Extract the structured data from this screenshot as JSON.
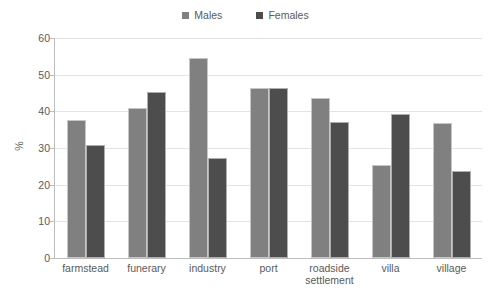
{
  "chart_data": {
    "type": "bar",
    "title": "",
    "xlabel": "",
    "ylabel": "%",
    "ylim": [
      0,
      60
    ],
    "ytick_step": 10,
    "yticks": [
      60,
      50,
      40,
      30,
      20,
      10,
      0
    ],
    "grid": true,
    "legend_position": "top-center",
    "categories": [
      "farmstead",
      "funerary",
      "industry",
      "port",
      "roadside\nsettlement",
      "villa",
      "village"
    ],
    "series": [
      {
        "name": "Males",
        "color": "#808080",
        "values": [
          37.6,
          40.9,
          54.6,
          46.3,
          43.6,
          25.5,
          36.8
        ]
      },
      {
        "name": "Females",
        "color": "#4d4d4d",
        "values": [
          30.9,
          45.3,
          27.4,
          46.3,
          37.2,
          39.4,
          23.6
        ]
      }
    ]
  },
  "legend": {
    "items": [
      {
        "label": "Males",
        "color": "#808080"
      },
      {
        "label": "Females",
        "color": "#4d4d4d"
      }
    ]
  },
  "axis": {
    "y_title": "%",
    "y_tick_labels": [
      "60",
      "50",
      "40",
      "30",
      "20",
      "10",
      "0"
    ]
  },
  "colors": {
    "males": "#808080",
    "females": "#4d4d4d",
    "gridline": "#e3e3e3",
    "axis": "#bdbdbd",
    "text": "#5a5a5a",
    "background": "#ffffff"
  }
}
